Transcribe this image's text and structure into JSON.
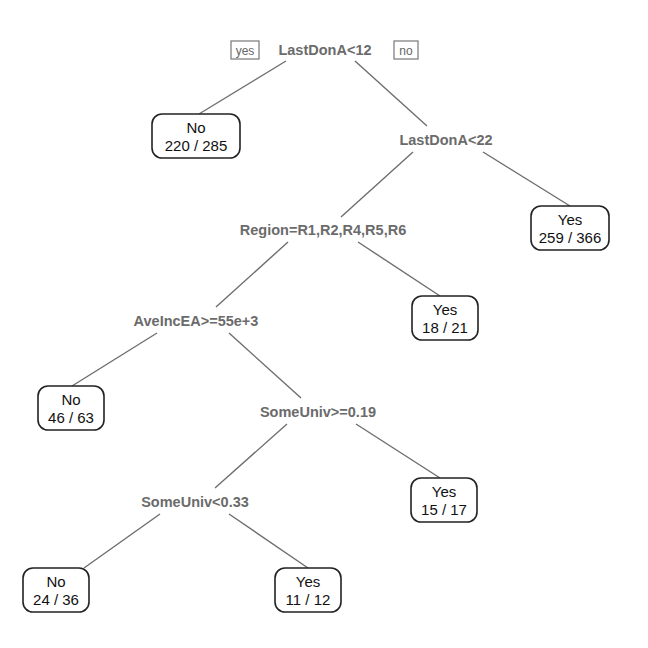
{
  "diagram": {
    "type": "decision-tree",
    "branch_labels": {
      "yes": "yes",
      "no": "no"
    },
    "splits": [
      {
        "id": "s1",
        "label": "LastDonA<12",
        "x": 325,
        "y": 50
      },
      {
        "id": "s2",
        "label": "LastDonA<22",
        "x": 446,
        "y": 140
      },
      {
        "id": "s3",
        "label": "Region=R1,R2,R4,R5,R6",
        "x": 323,
        "y": 230
      },
      {
        "id": "s4",
        "label": "AveIncEA>=55e+3",
        "x": 196,
        "y": 321
      },
      {
        "id": "s5",
        "label": "SomeUniv>=0.19",
        "x": 318,
        "y": 412
      },
      {
        "id": "s6",
        "label": "SomeUniv<0.33",
        "x": 195,
        "y": 502
      }
    ],
    "leaves": [
      {
        "id": "l1",
        "class": "No",
        "count": "220 / 285",
        "x": 196,
        "y": 136,
        "w": 88,
        "h": 44
      },
      {
        "id": "l2",
        "class": "Yes",
        "count": "259 / 366",
        "x": 570,
        "y": 228,
        "w": 78,
        "h": 44
      },
      {
        "id": "l3",
        "class": "Yes",
        "count": "18 / 21",
        "x": 445,
        "y": 318,
        "w": 66,
        "h": 44
      },
      {
        "id": "l4",
        "class": "No",
        "count": "46 / 63",
        "x": 71,
        "y": 408,
        "w": 66,
        "h": 44
      },
      {
        "id": "l5",
        "class": "Yes",
        "count": "15 / 17",
        "x": 444,
        "y": 500,
        "w": 66,
        "h": 44
      },
      {
        "id": "l6",
        "class": "No",
        "count": "24 / 36",
        "x": 56,
        "y": 590,
        "w": 66,
        "h": 44
      },
      {
        "id": "l7",
        "class": "Yes",
        "count": "11 / 12",
        "x": 308,
        "y": 590,
        "w": 66,
        "h": 44
      }
    ],
    "edges": [
      {
        "from": "s1",
        "to": "l1",
        "x1": 286,
        "y1": 61,
        "x2": 199,
        "y2": 114
      },
      {
        "from": "s1",
        "to": "s2",
        "x1": 355,
        "y1": 61,
        "x2": 427,
        "y2": 126
      },
      {
        "from": "s2",
        "to": "s3",
        "x1": 413,
        "y1": 152,
        "x2": 341,
        "y2": 217
      },
      {
        "from": "s2",
        "to": "l2",
        "x1": 483,
        "y1": 152,
        "x2": 570,
        "y2": 206
      },
      {
        "from": "s3",
        "to": "s4",
        "x1": 288,
        "y1": 242,
        "x2": 216,
        "y2": 307
      },
      {
        "from": "s3",
        "to": "l3",
        "x1": 358,
        "y1": 242,
        "x2": 440,
        "y2": 296
      },
      {
        "from": "s4",
        "to": "l4",
        "x1": 157,
        "y1": 333,
        "x2": 72,
        "y2": 386
      },
      {
        "from": "s4",
        "to": "s5",
        "x1": 229,
        "y1": 333,
        "x2": 301,
        "y2": 398
      },
      {
        "from": "s5",
        "to": "s6",
        "x1": 287,
        "y1": 424,
        "x2": 215,
        "y2": 488
      },
      {
        "from": "s5",
        "to": "l5",
        "x1": 356,
        "y1": 424,
        "x2": 440,
        "y2": 478
      },
      {
        "from": "s6",
        "to": "l6",
        "x1": 160,
        "y1": 514,
        "x2": 84,
        "y2": 568
      },
      {
        "from": "s6",
        "to": "l7",
        "x1": 229,
        "y1": 514,
        "x2": 308,
        "y2": 568
      }
    ]
  }
}
